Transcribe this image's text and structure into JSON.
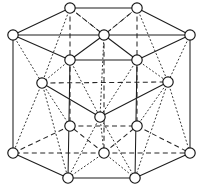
{
  "figure": {
    "type": "crystal-structure-diagram",
    "canvas": {
      "width": 203,
      "height": 193
    },
    "colors": {
      "background": "#ffffff",
      "line": "#1d1d1d",
      "dashed_line": "#262626",
      "dotted_line": "#343434",
      "atom_fill": "#ffffff",
      "atom_stroke": "#141414"
    },
    "atom_radius": 5.2,
    "line_styles": {
      "solid": "front/visible edges",
      "dashed": "hidden edges behind the cell",
      "dotted": "construction lines to hexagon centers"
    },
    "layers": [
      {
        "name": "top-basal-plane",
        "atoms": [
          {
            "id": "T-back-left",
            "label": "top back left corner",
            "x": 70,
            "y": 8
          },
          {
            "id": "T-back-right",
            "label": "top back right corner",
            "x": 137,
            "y": 8
          },
          {
            "id": "T-left",
            "label": "top left corner",
            "x": 13,
            "y": 35
          },
          {
            "id": "T-right",
            "label": "top right corner",
            "x": 190,
            "y": 35
          },
          {
            "id": "T-center",
            "label": "top face center atom",
            "x": 104,
            "y": 35
          },
          {
            "id": "T-front-left",
            "label": "top front left corner",
            "x": 70,
            "y": 60
          },
          {
            "id": "T-front-right",
            "label": "top front right corner",
            "x": 137,
            "y": 60
          }
        ]
      },
      {
        "name": "midplane",
        "atoms": [
          {
            "id": "M-left",
            "label": "midplane left interior atom",
            "x": 42,
            "y": 83
          },
          {
            "id": "M-right",
            "label": "midplane right interior atom",
            "x": 168,
            "y": 82
          },
          {
            "id": "M-front",
            "label": "midplane front interior atom",
            "x": 100,
            "y": 117
          }
        ]
      },
      {
        "name": "bottom-basal-plane",
        "atoms": [
          {
            "id": "B-back-left",
            "label": "bottom back left corner",
            "x": 70,
            "y": 126
          },
          {
            "id": "B-back-right",
            "label": "bottom back right corner",
            "x": 137,
            "y": 126
          },
          {
            "id": "B-left",
            "label": "bottom left corner",
            "x": 13,
            "y": 153
          },
          {
            "id": "B-right",
            "label": "bottom right corner",
            "x": 190,
            "y": 153
          },
          {
            "id": "B-center",
            "label": "bottom face center atom",
            "x": 104,
            "y": 153
          },
          {
            "id": "B-front-left",
            "label": "bottom front left corner",
            "x": 68,
            "y": 178
          },
          {
            "id": "B-front-right",
            "label": "bottom front right corner",
            "x": 135,
            "y": 178
          }
        ]
      }
    ]
  }
}
